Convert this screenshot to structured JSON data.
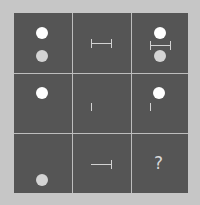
{
  "puzzle": {
    "type": "3x3 matrix reasoning",
    "colors": {
      "background": "#c6c6c6",
      "cell": "#555555",
      "grid_line": "#bdbdbd",
      "white_dot": "#ffffff",
      "grey_dot": "#d4d4d4",
      "line": "#d2d2d2"
    },
    "cells": [
      {
        "row": 1,
        "col": 1,
        "content": "white dot above grey dot"
      },
      {
        "row": 1,
        "col": 2,
        "content": "horizontal bar with end caps both sides"
      },
      {
        "row": 1,
        "col": 3,
        "content": "white dot, capped bar, grey dot (combined)"
      },
      {
        "row": 2,
        "col": 1,
        "content": "white dot"
      },
      {
        "row": 2,
        "col": 2,
        "content": "short vertical tick"
      },
      {
        "row": 2,
        "col": 3,
        "content": "white dot and vertical tick (combined)"
      },
      {
        "row": 3,
        "col": 1,
        "content": "grey dot at bottom"
      },
      {
        "row": 3,
        "col": 2,
        "content": "horizontal bar with right end cap"
      },
      {
        "row": 3,
        "col": 3,
        "content": "?"
      }
    ],
    "question_mark": "?"
  }
}
